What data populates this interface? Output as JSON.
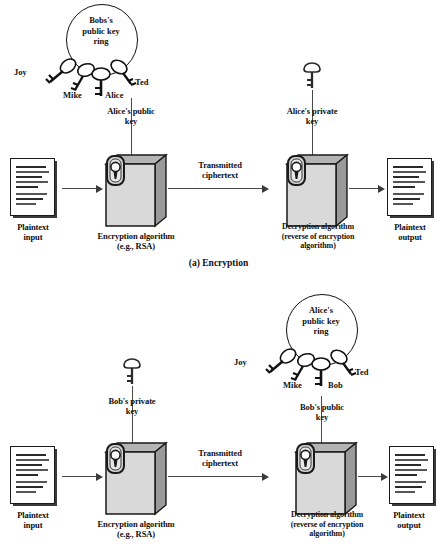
{
  "figure": {
    "panels": [
      {
        "id": "a",
        "caption": "(a) Encryption",
        "keyring": {
          "title": "Bobs's\npublic key\nring",
          "keys": [
            {
              "name": "Joy"
            },
            {
              "name": "Mike"
            },
            {
              "name": "Alice"
            },
            {
              "name": "Ted"
            }
          ]
        },
        "input_doc": {
          "label": "Plaintext\ninput"
        },
        "output_doc": {
          "label": "Plaintext\noutput"
        },
        "encrypt_box": {
          "label": "Encryption algorithm\n(e.g., RSA)"
        },
        "decrypt_box": {
          "label": "Decryption algorithm\n(reverse of encryption\nalgorithm)"
        },
        "encrypt_key_label": "Alice's public\nkey",
        "decrypt_key_label": "Alice's private\nkey",
        "channel_label": "Transmitted\nciphertext"
      },
      {
        "id": "b",
        "caption": "",
        "keyring": {
          "title": "Alice's\npublic key\nring",
          "keys": [
            {
              "name": "Joy"
            },
            {
              "name": "Mike"
            },
            {
              "name": "Bob"
            },
            {
              "name": "Ted"
            }
          ]
        },
        "input_doc": {
          "label": "Plaintext\ninput"
        },
        "output_doc": {
          "label": "Plaintext\noutput"
        },
        "encrypt_box": {
          "label": "Encryption algorithm\n(e.g., RSA)"
        },
        "decrypt_box": {
          "label": "Decryption algorithm\n(reverse of encryption\nalgorithm)"
        },
        "encrypt_key_label": "Bob's private\nkey",
        "decrypt_key_label": "Bob's public\nkey",
        "channel_label": "Transmitted\nciphertext"
      }
    ]
  },
  "colors": {
    "ink": "#111111",
    "box_face": "#d9d9d9",
    "box_side": "#9a9a9a",
    "arrow": "#4a4a4a"
  }
}
